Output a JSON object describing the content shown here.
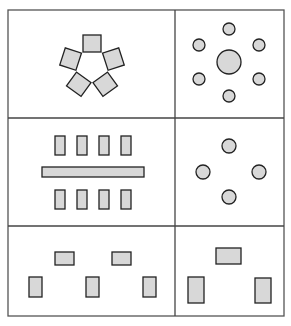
{
  "diagram": {
    "colors": {
      "background": "#ffffff",
      "shape_fill": "#d8d8d8",
      "shape_stroke": "#222222",
      "grid_stroke": "#444444"
    },
    "grid": {
      "rows": 3,
      "cols": 2
    },
    "panels": [
      {
        "id": "radial-squares",
        "position": "top-left",
        "shapes": "5 squares arranged around a pentagon"
      },
      {
        "id": "radial-circles",
        "position": "top-right",
        "shapes": "1 large central circle surrounded by 6 small circles"
      },
      {
        "id": "bilateral-rects",
        "position": "middle-left",
        "shapes": "2 rows of 4 small rectangles separated by a long horizontal bar"
      },
      {
        "id": "four-circles",
        "position": "middle-right",
        "shapes": "4 circles in a diamond arrangement"
      },
      {
        "id": "rhythm-rects",
        "position": "bottom-left",
        "shapes": "2 horizontal rectangles above 3 vertical rectangles"
      },
      {
        "id": "triangle-rects",
        "position": "bottom-right",
        "shapes": "1 horizontal rectangle above 2 vertical rectangles"
      }
    ]
  }
}
